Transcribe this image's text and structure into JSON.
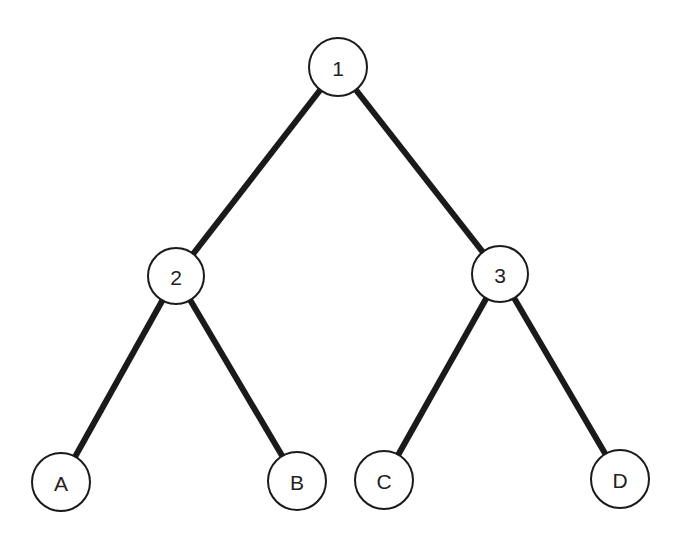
{
  "diagram": {
    "type": "binary-tree",
    "nodes": [
      {
        "id": "1",
        "label": "1",
        "x": 338,
        "y": 67
      },
      {
        "id": "2",
        "label": "2",
        "x": 176,
        "y": 276
      },
      {
        "id": "3",
        "label": "3",
        "x": 500,
        "y": 274
      },
      {
        "id": "A",
        "label": "A",
        "x": 61,
        "y": 482
      },
      {
        "id": "B",
        "label": "B",
        "x": 297,
        "y": 481
      },
      {
        "id": "C",
        "label": "C",
        "x": 384,
        "y": 480
      },
      {
        "id": "D",
        "label": "D",
        "x": 620,
        "y": 479
      }
    ],
    "edges": [
      {
        "from": "1",
        "to": "2"
      },
      {
        "from": "1",
        "to": "3"
      },
      {
        "from": "2",
        "to": "A"
      },
      {
        "from": "2",
        "to": "B"
      },
      {
        "from": "3",
        "to": "C"
      },
      {
        "from": "3",
        "to": "D"
      }
    ]
  }
}
